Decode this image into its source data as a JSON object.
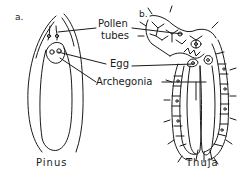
{
  "diagram": {
    "panels": [
      {
        "letter": "a.",
        "caption": "Pinus"
      },
      {
        "letter": "b.",
        "caption": "Thuja"
      }
    ],
    "labels": {
      "pollen_tubes_line1": "Pollen",
      "pollen_tubes_line2": "tubes",
      "egg": "Egg",
      "archegonia": "Archegonia"
    },
    "colors": {
      "ink": "#1a1a1a",
      "background": "#ffffff"
    }
  }
}
